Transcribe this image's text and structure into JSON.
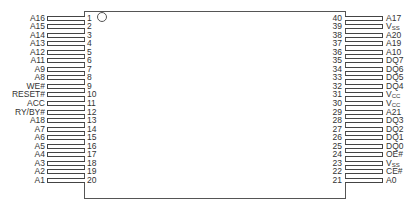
{
  "diagram": {
    "type": "ic-pinout",
    "package_pin_count": 40,
    "pin1_marker": "circle",
    "left_pins": [
      {
        "num": "1",
        "name": "A16"
      },
      {
        "num": "2",
        "name": "A15"
      },
      {
        "num": "3",
        "name": "A14"
      },
      {
        "num": "4",
        "name": "A13"
      },
      {
        "num": "5",
        "name": "A12"
      },
      {
        "num": "6",
        "name": "A11"
      },
      {
        "num": "7",
        "name": "A9"
      },
      {
        "num": "8",
        "name": "A8"
      },
      {
        "num": "9",
        "name": "WE#"
      },
      {
        "num": "10",
        "name": "RESET#"
      },
      {
        "num": "11",
        "name": "ACC"
      },
      {
        "num": "12",
        "name": "RY/BY#"
      },
      {
        "num": "13",
        "name": "A18"
      },
      {
        "num": "14",
        "name": "A7"
      },
      {
        "num": "15",
        "name": "A6"
      },
      {
        "num": "16",
        "name": "A5"
      },
      {
        "num": "17",
        "name": "A4"
      },
      {
        "num": "18",
        "name": "A3"
      },
      {
        "num": "19",
        "name": "A2"
      },
      {
        "num": "20",
        "name": "A1"
      }
    ],
    "right_pins": [
      {
        "num": "40",
        "name": "A17",
        "base": "A17",
        "sub": ""
      },
      {
        "num": "39",
        "name": "VSS",
        "base": "V",
        "sub": "SS"
      },
      {
        "num": "38",
        "name": "A20",
        "base": "A20",
        "sub": ""
      },
      {
        "num": "37",
        "name": "A19",
        "base": "A19",
        "sub": ""
      },
      {
        "num": "36",
        "name": "A10",
        "base": "A10",
        "sub": ""
      },
      {
        "num": "35",
        "name": "DQ7",
        "base": "DQ7",
        "sub": ""
      },
      {
        "num": "34",
        "name": "DQ6",
        "base": "DQ6",
        "sub": ""
      },
      {
        "num": "33",
        "name": "DQ5",
        "base": "DQ5",
        "sub": ""
      },
      {
        "num": "32",
        "name": "DQ4",
        "base": "DQ4",
        "sub": ""
      },
      {
        "num": "31",
        "name": "VCC",
        "base": "V",
        "sub": "CC"
      },
      {
        "num": "30",
        "name": "VCC",
        "base": "V",
        "sub": "CC"
      },
      {
        "num": "29",
        "name": "A21",
        "base": "A21",
        "sub": ""
      },
      {
        "num": "28",
        "name": "DQ3",
        "base": "DQ3",
        "sub": ""
      },
      {
        "num": "27",
        "name": "DQ2",
        "base": "DQ2",
        "sub": ""
      },
      {
        "num": "26",
        "name": "DQ1",
        "base": "DQ1",
        "sub": ""
      },
      {
        "num": "25",
        "name": "DQ0",
        "base": "DQ0",
        "sub": ""
      },
      {
        "num": "24",
        "name": "OE#",
        "base": "OE#",
        "sub": ""
      },
      {
        "num": "23",
        "name": "VSS",
        "base": "V",
        "sub": "SS"
      },
      {
        "num": "22",
        "name": "CE#",
        "base": "CE#",
        "sub": ""
      },
      {
        "num": "21",
        "name": "A0",
        "base": "A0",
        "sub": ""
      }
    ]
  }
}
